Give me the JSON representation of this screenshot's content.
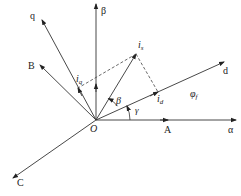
{
  "diagram": {
    "type": "vector-phasor-diagram",
    "origin": {
      "label": "O",
      "x": 96,
      "y": 120
    },
    "axes": [
      {
        "id": "alpha",
        "label": "α",
        "tip": [
          236,
          120
        ],
        "label_pos": [
          228,
          133
        ]
      },
      {
        "id": "beta",
        "label": "β",
        "tip": [
          96,
          4
        ],
        "label_pos": [
          101,
          14
        ]
      },
      {
        "id": "d",
        "label": "d",
        "tip": [
          224,
          62
        ],
        "label_pos": [
          223,
          74
        ]
      },
      {
        "id": "q",
        "label": "q",
        "tip": [
          42,
          20
        ],
        "label_pos": [
          30,
          19
        ]
      },
      {
        "id": "A",
        "label": "A",
        "tip": [
          168,
          120
        ],
        "label_pos": [
          164,
          133
        ]
      },
      {
        "id": "B",
        "label": "B",
        "tip": [
          40,
          65
        ],
        "label_pos": [
          28,
          69
        ]
      },
      {
        "id": "C",
        "label": "C",
        "tip": [
          13,
          178
        ],
        "label_pos": [
          17,
          186
        ]
      }
    ],
    "vectors": [
      {
        "id": "is",
        "label": "i",
        "subscript": "s",
        "tip": [
          136,
          54
        ],
        "label_pos": [
          138,
          48
        ]
      },
      {
        "id": "id",
        "label": "i",
        "subscript": "d",
        "tip": [
          158,
          92
        ],
        "label_pos": [
          157,
          102
        ]
      },
      {
        "id": "iq",
        "label": "i",
        "subscript": "q",
        "tip": [
          78,
          88
        ],
        "label_pos": [
          76,
          82
        ]
      }
    ],
    "annotations": {
      "flux_label": "φ",
      "flux_subscript": "f",
      "flux_pos": [
        190,
        97
      ],
      "angle_beta": "β",
      "angle_beta_pos": [
        116,
        104
      ],
      "angle_gamma": "γ",
      "angle_gamma_pos": [
        135,
        113
      ]
    }
  }
}
